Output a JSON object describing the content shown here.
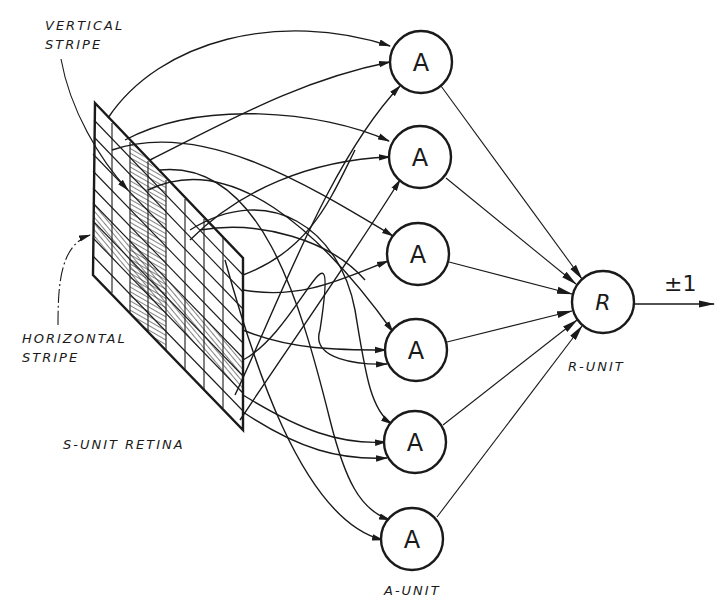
{
  "diagram": {
    "labels": {
      "vertical_stripe_line1": "VERTICAL",
      "vertical_stripe_line2": "STRIPE",
      "horizontal_stripe_line1": "HORIZONTAL",
      "horizontal_stripe_line2": "STRIPE",
      "retina": "S-UNIT RETINA",
      "a_unit": "A-UNIT",
      "r_unit": "R-UNIT",
      "output": "±1"
    },
    "a_units": [
      {
        "letter": "A",
        "cx": 421,
        "cy": 62
      },
      {
        "letter": "A",
        "cx": 420,
        "cy": 157
      },
      {
        "letter": "A",
        "cx": 418,
        "cy": 254
      },
      {
        "letter": "A",
        "cx": 416,
        "cy": 350
      },
      {
        "letter": "A",
        "cx": 415,
        "cy": 442
      },
      {
        "letter": "A",
        "cx": 412,
        "cy": 539
      }
    ],
    "r_unit": {
      "letter": "R",
      "cx": 603,
      "cy": 302
    },
    "retina": {
      "columns": 8,
      "rows": 10,
      "vertical_stripe_columns": [
        3,
        4
      ],
      "horizontal_stripe_rows": [
        5,
        6
      ]
    },
    "colors": {
      "ink": "#1a1a1a",
      "background": "#ffffff"
    }
  }
}
